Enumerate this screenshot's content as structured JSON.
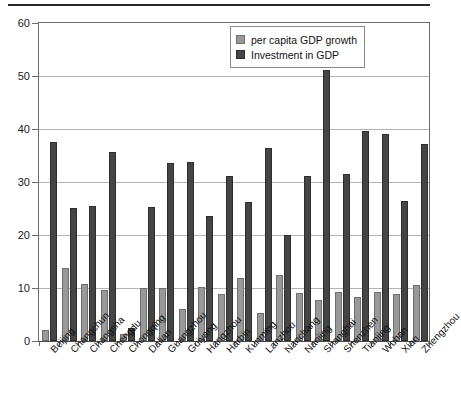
{
  "chart_data": {
    "type": "bar",
    "title": "",
    "xlabel": "",
    "ylabel": "",
    "ylim": [
      0,
      60
    ],
    "yticks": [
      0,
      10,
      20,
      30,
      40,
      50,
      60
    ],
    "grid": true,
    "legend_position": "top-right",
    "categories": [
      "Beijing",
      "Changchun",
      "Changsha",
      "Chengdu",
      "Chongqing",
      "Dalian",
      "Guangzhou",
      "Guiyang",
      "Hangzhou",
      "Harbin",
      "Kunming",
      "Lanzhou",
      "Nanchang",
      "Nanjing",
      "Shanghai",
      "Shenzhen",
      "Tianjing",
      "Wuhan",
      "Xian",
      "Zhengzhou"
    ],
    "series": [
      {
        "name": "per capita GDP growth",
        "color": "#999999",
        "values": [
          2.0,
          13.7,
          10.7,
          9.6,
          1.4,
          10.0,
          10.0,
          6.0,
          10.2,
          8.9,
          11.8,
          5.2,
          12.5,
          9.0,
          7.8,
          9.3,
          8.3,
          9.3,
          8.9,
          10.5
        ]
      },
      {
        "name": "Investment in GDP",
        "color": "#454545",
        "values": [
          37.5,
          25.1,
          25.5,
          35.6,
          2.5,
          25.2,
          33.5,
          33.8,
          23.5,
          31.2,
          26.2,
          36.4,
          20.0,
          31.2,
          51.2,
          31.5,
          39.7,
          39.0,
          26.4,
          37.2
        ]
      }
    ]
  },
  "legend": {
    "items": [
      {
        "label": "per capita GDP growth",
        "swatch": "light"
      },
      {
        "label": "Investment in GDP",
        "swatch": "dark"
      }
    ]
  }
}
